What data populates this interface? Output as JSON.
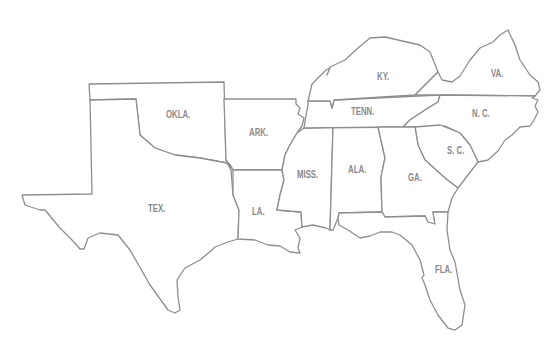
{
  "map": {
    "title": "",
    "line_color": "#8e8e8e",
    "label_color": "#8a8a8a",
    "states": [
      {
        "id": "tex",
        "label": "TEX."
      },
      {
        "id": "okla",
        "label": "OKLA."
      },
      {
        "id": "ark",
        "label": "ARK."
      },
      {
        "id": "la",
        "label": "LA."
      },
      {
        "id": "miss",
        "label": "MISS."
      },
      {
        "id": "ala",
        "label": "ALA."
      },
      {
        "id": "tenn",
        "label": "TENN."
      },
      {
        "id": "ky",
        "label": "KY."
      },
      {
        "id": "va",
        "label": "VA."
      },
      {
        "id": "nc",
        "label": "N. C."
      },
      {
        "id": "sc",
        "label": "S. C."
      },
      {
        "id": "ga",
        "label": "GA."
      },
      {
        "id": "fla",
        "label": "FLA."
      }
    ]
  }
}
